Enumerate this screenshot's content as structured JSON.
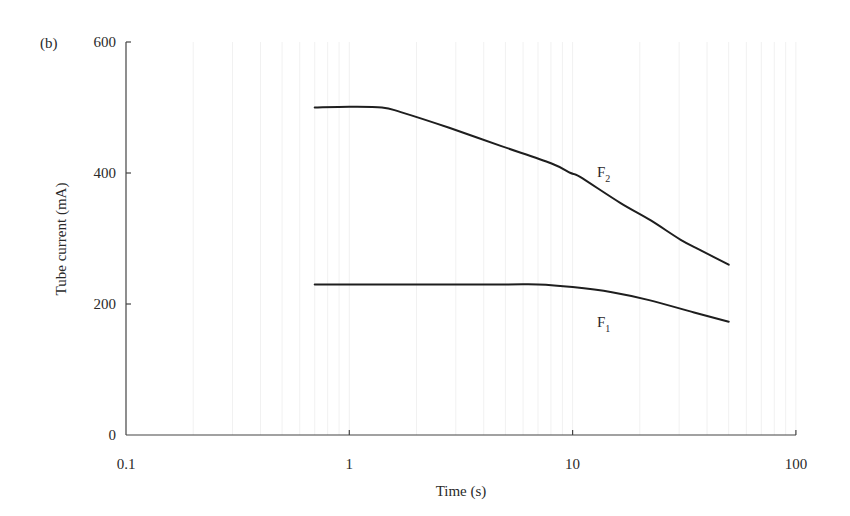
{
  "panel_label": "(b)",
  "chart_data": {
    "type": "line",
    "title": "",
    "xlabel": "Time (s)",
    "ylabel": "Tube current (mA)",
    "xscale": "log",
    "xlim": [
      0.1,
      100
    ],
    "ylim": [
      0,
      600
    ],
    "xticks": [
      0.1,
      1,
      10,
      100
    ],
    "xtick_labels": [
      "0.1",
      "1",
      "10",
      "100"
    ],
    "yticks": [
      0,
      200,
      400,
      600
    ],
    "ytick_labels": [
      "0",
      "200",
      "400",
      "600"
    ],
    "grid": "faint vertical minor lines",
    "legend": "none (inline labels)",
    "series": [
      {
        "name": "F2",
        "label_main": "F",
        "label_sub": "2",
        "x": [
          0.7,
          1.0,
          1.4,
          1.7,
          2.8,
          4.8,
          8.0,
          9.8,
          10.8,
          16.4,
          22.3,
          30.5,
          37.5,
          50
        ],
        "y": [
          500,
          501,
          500,
          493,
          469,
          441,
          415,
          400,
          394,
          354,
          328,
          298,
          282,
          260
        ]
      },
      {
        "name": "F1",
        "label_main": "F",
        "label_sub": "1",
        "x": [
          0.7,
          1,
          2,
          5,
          7,
          10,
          15,
          22,
          35,
          50
        ],
        "y": [
          230,
          230,
          230,
          230,
          230,
          226,
          218,
          206,
          187,
          173
        ]
      }
    ]
  }
}
